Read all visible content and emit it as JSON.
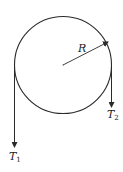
{
  "diagram": {
    "labels": {
      "radius": "R",
      "tension_left_main": "T",
      "tension_left_sub": "1",
      "tension_right_main": "T",
      "tension_right_sub": "2"
    },
    "colors": {
      "stroke": "#2a2a2a",
      "text": "#222222"
    }
  }
}
